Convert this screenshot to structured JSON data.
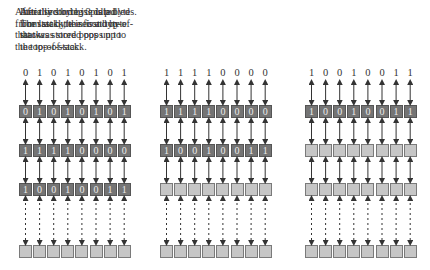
{
  "panels": [
    {
      "caption": [
        "Initially storing 3 data bytes.",
        "The last byte in is at top-of-",
        "stack."
      ],
      "input_bits": [
        "0",
        "1",
        "0",
        "1",
        "0",
        "1",
        "0",
        "1"
      ],
      "rows": [
        {
          "filled": true,
          "bits": [
            "0",
            "1",
            "0",
            "1",
            "0",
            "1",
            "0",
            "1"
          ]
        },
        {
          "filled": true,
          "bits": [
            "1",
            "1",
            "1",
            "1",
            "0",
            "0",
            "0",
            "0"
          ]
        },
        {
          "filled": true,
          "bits": [
            "1",
            "0",
            "0",
            "1",
            "0",
            "0",
            "1",
            "1"
          ]
        },
        {
          "filled": false,
          "bits": [
            "",
            "",
            "",
            "",
            "",
            "",
            "",
            ""
          ]
        }
      ]
    },
    {
      "caption": [
        "After third byte is pulled",
        "from stack, the second byte",
        "that was stored pops up to",
        "the top-of-stack."
      ],
      "input_bits": [
        "1",
        "1",
        "1",
        "1",
        "0",
        "0",
        "0",
        "0"
      ],
      "rows": [
        {
          "filled": true,
          "bits": [
            "1",
            "1",
            "1",
            "1",
            "0",
            "0",
            "0",
            "0"
          ]
        },
        {
          "filled": true,
          "bits": [
            "1",
            "0",
            "0",
            "1",
            "0",
            "0",
            "1",
            "1"
          ]
        },
        {
          "filled": false,
          "bits": [
            "",
            "",
            "",
            "",
            "",
            "",
            "",
            ""
          ]
        },
        {
          "filled": false,
          "bits": [
            "",
            "",
            "",
            "",
            "",
            "",
            "",
            ""
          ]
        }
      ]
    },
    {
      "caption": [
        "After second byte is pulled",
        "from stack, the first byte",
        "that was stored pops up to",
        "the top-of-stack."
      ],
      "input_bits": [
        "1",
        "0",
        "0",
        "1",
        "0",
        "0",
        "1",
        "1"
      ],
      "rows": [
        {
          "filled": true,
          "bits": [
            "1",
            "0",
            "0",
            "1",
            "0",
            "0",
            "1",
            "1"
          ]
        },
        {
          "filled": false,
          "bits": [
            "",
            "",
            "",
            "",
            "",
            "",
            "",
            ""
          ]
        },
        {
          "filled": false,
          "bits": [
            "",
            "",
            "",
            "",
            "",
            "",
            "",
            ""
          ]
        },
        {
          "filled": false,
          "bits": [
            "",
            "",
            "",
            "",
            "",
            "",
            "",
            ""
          ]
        }
      ]
    }
  ],
  "colors": {
    "filled_cell": "#747474",
    "empty_cell": "#c6c6c6",
    "arrow": "#333333"
  }
}
